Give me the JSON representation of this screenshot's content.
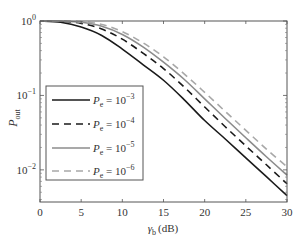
{
  "chart_data": {
    "type": "line",
    "title": "",
    "xlabel": "γb (dB)",
    "xlabel_main": "γ",
    "xlabel_sub": "b",
    "xlabel_unit": "(dB)",
    "ylabel": "Pout",
    "ylabel_main": "P",
    "ylabel_sub": "out",
    "yscale": "log",
    "xlim": [
      0,
      30
    ],
    "ylim": [
      0.0037,
      1
    ],
    "grid": false,
    "legend_position": "lower left",
    "x_ticks": [
      0,
      5,
      10,
      15,
      20,
      25,
      30
    ],
    "x_tick_labels": [
      "0",
      "5",
      "10",
      "15",
      "20",
      "25",
      "30"
    ],
    "y_ticks": [
      1,
      0.1,
      0.01
    ],
    "y_tick_labels": [
      {
        "base": "10",
        "exp": "0"
      },
      {
        "base": "10",
        "exp": "−1"
      },
      {
        "base": "10",
        "exp": "−2"
      }
    ],
    "x": [
      0,
      2.5,
      5,
      7.5,
      10,
      12.5,
      15,
      17.5,
      20,
      22.5,
      25,
      27.5,
      30
    ],
    "series": [
      {
        "name": "Pe = 10^-3",
        "label_main": "P",
        "label_sub": "e",
        "label_eq": " = 10",
        "label_exp": "−3",
        "color": "#1a1a1a",
        "dash": "",
        "width": 1.6,
        "values": [
          1.0,
          0.96,
          0.83,
          0.64,
          0.42,
          0.26,
          0.16,
          0.088,
          0.046,
          0.026,
          0.0145,
          0.0081,
          0.0045
        ]
      },
      {
        "name": "Pe = 10^-4",
        "label_main": "P",
        "label_sub": "e",
        "label_eq": " = 10",
        "label_exp": "−4",
        "color": "#1a1a1a",
        "dash": "7,5",
        "width": 1.6,
        "values": [
          1.0,
          0.99,
          0.93,
          0.78,
          0.57,
          0.37,
          0.23,
          0.13,
          0.07,
          0.038,
          0.021,
          0.0117,
          0.0065
        ]
      },
      {
        "name": "Pe = 10^-5",
        "label_main": "P",
        "label_sub": "e",
        "label_eq": " = 10",
        "label_exp": "−5",
        "color": "#8c8c8c",
        "dash": "",
        "width": 1.6,
        "values": [
          1.0,
          0.995,
          0.96,
          0.85,
          0.66,
          0.45,
          0.28,
          0.165,
          0.09,
          0.049,
          0.027,
          0.015,
          0.0085
        ]
      },
      {
        "name": "Pe = 10^-6",
        "label_main": "P",
        "label_sub": "e",
        "label_eq": " = 10",
        "label_exp": "−6",
        "color": "#a8a8a8",
        "dash": "7,5",
        "width": 1.6,
        "values": [
          1.0,
          0.998,
          0.98,
          0.9,
          0.72,
          0.51,
          0.33,
          0.195,
          0.11,
          0.061,
          0.034,
          0.019,
          0.011
        ]
      }
    ]
  }
}
